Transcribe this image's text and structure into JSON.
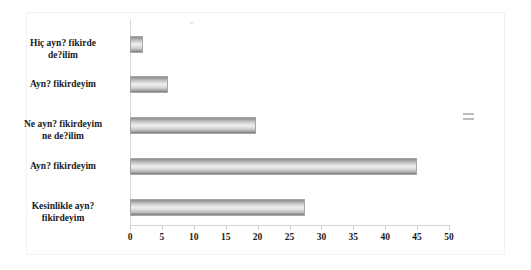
{
  "chart_data": {
    "type": "bar",
    "orientation": "horizontal",
    "title": "",
    "xlabel": "",
    "ylabel": "",
    "categories": [
      "Kesinlikle ayn?\nfikirdeyim",
      "Ayn? fikirdeyim",
      "Ne ayn? fikirdeyim\nne de?ilim",
      "Ayn? fikirdeyim",
      "Hiç ayn? fikirde\nde?ilim"
    ],
    "values": [
      27.5,
      45,
      19.7,
      6,
      2
    ],
    "xlim": [
      0,
      50
    ],
    "xticks": [
      0,
      5,
      10,
      15,
      20,
      25,
      30,
      35,
      40,
      45,
      50
    ],
    "xtick_labels": [
      "0",
      "5",
      "10",
      "15",
      "20",
      "25",
      "30",
      "35",
      "40",
      "45",
      "50"
    ],
    "grid": false,
    "legend": false,
    "bar_color": "#cfcfcf",
    "bar_border_color": "#a6a6a6",
    "axis_color": "#d9d9d9",
    "text_color": "#1a1a1a",
    "frame_border_color": "#f2f2f2"
  },
  "bars": [
    {
      "label": "Hiç ayn? fikirde\nde?ilim",
      "value": 2,
      "top": 23,
      "width": 13
    },
    {
      "label": "Ayn? fikirdeyim",
      "value": 6,
      "top": 63,
      "width": 38
    },
    {
      "label": "Ne ayn? fikirdeyim\nne de?ilim",
      "value": 19.7,
      "top": 104,
      "width": 126
    },
    {
      "label": "Ayn? fikirdeyim",
      "value": 45,
      "top": 145,
      "width": 287
    },
    {
      "label": "Kesinlikle ayn?\nfikirdeyim",
      "value": 27.5,
      "top": 186,
      "width": 175
    }
  ],
  "legend_artifact": {
    "name": "legend-marker"
  }
}
